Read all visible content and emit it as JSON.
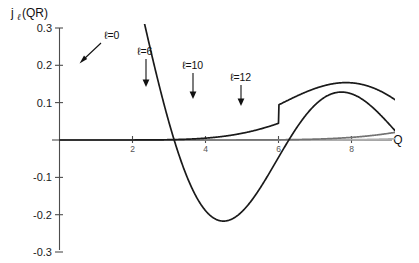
{
  "figure": {
    "caption_text": "",
    "background_color": "#ffffff"
  },
  "axes": {
    "ylabel_main": "j",
    "ylabel_sub": "ℓ",
    "ylabel_rest": "(QR)",
    "xlabel": "Q",
    "y_ticks": [
      "0.3",
      "0.2",
      "0.1",
      "",
      "-0.1",
      "-0.2",
      "-0.3"
    ],
    "y_tick_values": [
      0.3,
      0.2,
      0.1,
      0.0,
      -0.1,
      -0.2,
      -0.3
    ],
    "x_ticks": [
      "2",
      "4",
      "6",
      "8"
    ],
    "x_tick_values": [
      2,
      4,
      6,
      8
    ]
  },
  "annotations": [
    {
      "name": "label-l0",
      "text": "ℓ=0",
      "x": 104,
      "y": 36
    },
    {
      "name": "label-l6",
      "text": "ℓ=6",
      "x": 137,
      "y": 52
    },
    {
      "name": "label-l10",
      "text": "ℓ=10",
      "x": 182,
      "y": 66
    },
    {
      "name": "label-l12",
      "text": "ℓ=12",
      "x": 230,
      "y": 78
    }
  ],
  "chart_data": {
    "type": "line",
    "title": "",
    "xlabel": "Q",
    "ylabel": "j_l(QR)",
    "xlim": [
      0,
      8.9
    ],
    "ylim": [
      -0.3,
      0.32
    ],
    "grid": false,
    "legend": "inline-annotations",
    "x_tick_labels": [
      "2",
      "4",
      "6",
      "8"
    ],
    "y_tick_labels": [
      "0.3",
      "0.2",
      "0.1",
      "-0.1",
      "-0.2",
      "-0.3"
    ],
    "series": [
      {
        "name": "ℓ=0",
        "order": 0,
        "color": "#1a1a1a",
        "linewidth": 1.7,
        "first_max_value": 0.3,
        "first_min_value": -0.217,
        "first_min_x": 1.25,
        "notes": "steeply descending from above 0.3 at left edge, crosses zero near Q=0.85, deep minimum -0.217 near Q=1.25"
      },
      {
        "name": "ℓ=6",
        "order": 6,
        "color": "#1a1a1a",
        "linewidth": 1.7,
        "first_max_value": 0.152,
        "first_max_x": 2.15,
        "notes": "broad first maximum 0.152 near Q=2.15, then damped oscillation"
      },
      {
        "name": "ℓ=10",
        "order": 10,
        "color": "#737373",
        "linewidth": 1.7,
        "first_max_value": 0.127,
        "first_max_x": 3.1,
        "notes": "first maximum 0.127 near Q=3.1"
      },
      {
        "name": "ℓ=12",
        "order": 12,
        "color": "#b0b0b0",
        "linewidth": 1.7,
        "first_max_value": 0.118,
        "first_max_x": 3.6,
        "notes": "first maximum 0.118 near Q=3.6, lightest gray trace"
      }
    ],
    "sampled_points": {
      "x": [
        0.2,
        0.6,
        1.0,
        1.4,
        1.8,
        2.2,
        2.6,
        3.0,
        3.4,
        3.8,
        4.2,
        4.6,
        5.0,
        5.4,
        5.8,
        6.2,
        6.6,
        7.0,
        7.4,
        7.8,
        8.2,
        8.6
      ],
      "l0": [
        0.3,
        0.2,
        0.05,
        -0.13,
        -0.21,
        -0.17,
        -0.07,
        0.03,
        0.09,
        0.1,
        0.06,
        0.0,
        -0.05,
        -0.07,
        -0.06,
        -0.02,
        0.02,
        0.05,
        0.06,
        0.04,
        0.0,
        -0.03
      ],
      "l6": [
        0.0,
        0.0,
        0.01,
        0.04,
        0.09,
        0.14,
        0.15,
        0.12,
        0.05,
        -0.03,
        -0.09,
        -0.12,
        -0.1,
        -0.05,
        0.01,
        0.06,
        0.09,
        0.08,
        0.04,
        -0.01,
        -0.05,
        -0.07
      ],
      "l10": [
        0.0,
        0.0,
        0.0,
        0.0,
        0.01,
        0.03,
        0.07,
        0.11,
        0.13,
        0.11,
        0.06,
        -0.01,
        -0.07,
        -0.11,
        -0.1,
        -0.06,
        0.0,
        0.06,
        0.09,
        0.09,
        0.05,
        -0.01
      ],
      "l12": [
        0.0,
        0.0,
        0.0,
        0.0,
        0.0,
        0.01,
        0.03,
        0.07,
        0.1,
        0.12,
        0.11,
        0.07,
        0.01,
        -0.05,
        -0.09,
        -0.1,
        -0.08,
        -0.03,
        0.03,
        0.07,
        0.09,
        0.08
      ]
    }
  }
}
